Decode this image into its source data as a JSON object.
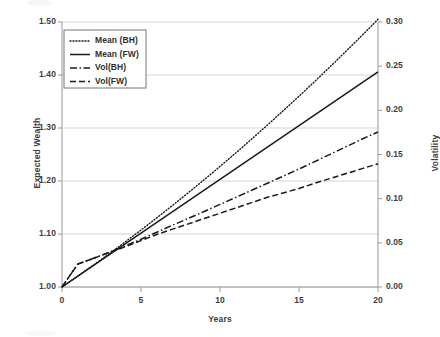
{
  "chart_data": {
    "type": "line",
    "title": "",
    "xlabel": "Years",
    "ylabel": "Expected Wealth",
    "y2label": "Volatility",
    "xlim": [
      0,
      20
    ],
    "ylim": [
      1.0,
      1.5
    ],
    "y2lim": [
      0.0,
      0.3
    ],
    "xticks": [
      "0",
      "5",
      "10",
      "15",
      "20"
    ],
    "xtick_values": [
      0,
      5,
      10,
      15,
      20
    ],
    "yticks": [
      "1.00",
      "1.10",
      "1.20",
      "1.30",
      "1.40",
      "1.50"
    ],
    "ytick_values": [
      1.0,
      1.1,
      1.2,
      1.3,
      1.4,
      1.5
    ],
    "y2ticks": [
      "0.00",
      "0.05",
      "0.10",
      "0.15",
      "0.20",
      "0.25",
      "0.30"
    ],
    "y2tick_values": [
      0.0,
      0.05,
      0.1,
      0.15,
      0.2,
      0.25,
      0.3
    ],
    "grid": "horizontal",
    "legend_position": "top-left",
    "x": [
      0,
      1,
      2,
      3,
      4,
      5,
      6,
      7,
      8,
      9,
      10,
      11,
      12,
      13,
      14,
      15,
      16,
      17,
      18,
      19,
      20
    ],
    "series": [
      {
        "name": "Mean (BH)",
        "axis": "left",
        "style": "dotted",
        "values": [
          1.0,
          1.0205,
          1.0415,
          1.063,
          1.085,
          1.1075,
          1.1305,
          1.154,
          1.178,
          1.2025,
          1.2275,
          1.253,
          1.279,
          1.3055,
          1.3325,
          1.36,
          1.388,
          1.4165,
          1.4455,
          1.475,
          1.505
        ]
      },
      {
        "name": "Mean (FW)",
        "axis": "left",
        "style": "solid",
        "values": [
          1.0,
          1.0203,
          1.0406,
          1.0609,
          1.0812,
          1.1015,
          1.1218,
          1.1421,
          1.1624,
          1.1827,
          1.203,
          1.2233,
          1.2436,
          1.2639,
          1.2842,
          1.3045,
          1.3248,
          1.3451,
          1.3654,
          1.3857,
          1.406
        ]
      },
      {
        "name": "Vol(BH)",
        "axis": "right",
        "style": "dashdot",
        "values": [
          0.0,
          0.026,
          0.0325,
          0.0395,
          0.0465,
          0.054,
          0.062,
          0.07,
          0.0777,
          0.0855,
          0.0935,
          0.1015,
          0.1095,
          0.1175,
          0.1255,
          0.1335,
          0.142,
          0.1505,
          0.159,
          0.1675,
          0.1755
        ]
      },
      {
        "name": "Vol(FW)",
        "axis": "right",
        "style": "dashed",
        "values": [
          0.0,
          0.026,
          0.0325,
          0.039,
          0.0455,
          0.0525,
          0.0595,
          0.0655,
          0.0715,
          0.0775,
          0.0835,
          0.0895,
          0.0955,
          0.1015,
          0.1065,
          0.1115,
          0.1175,
          0.123,
          0.1285,
          0.134,
          0.1395
        ]
      }
    ]
  },
  "legend": {
    "items": [
      {
        "label": "Mean (BH)",
        "style": "dotted"
      },
      {
        "label": "Mean (FW)",
        "style": "solid"
      },
      {
        "label": "Vol(BH)",
        "style": "dashdot"
      },
      {
        "label": "Vol(FW)",
        "style": "dashed"
      }
    ]
  },
  "colors": {
    "line": "#1a1a1a",
    "grid": "#d3d3d3",
    "axis": "#9a9a9a",
    "text": "#3d3d3d",
    "background": "#ffffff"
  }
}
